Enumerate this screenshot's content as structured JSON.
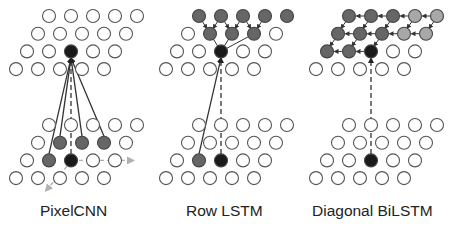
{
  "panels": [
    {
      "title": "PixelCNN",
      "label_x": 40
    },
    {
      "title": "Row LSTM",
      "label_x": 186
    },
    {
      "title": "Diagonal BiLSTM",
      "label_x": 312
    }
  ],
  "colors": {
    "open_stroke": "#555555",
    "context": "#666666",
    "context_light": "#a8a8a8",
    "current": "#1a1a1a",
    "arrow": "#333333",
    "arrow_light": "#aaaaaa"
  }
}
